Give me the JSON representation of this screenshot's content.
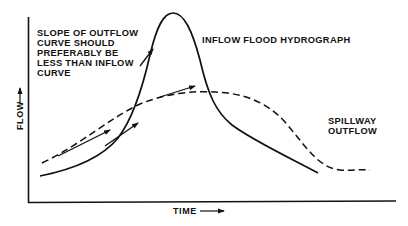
{
  "diagram": {
    "annotation_lines": [
      "SLOPE OF OUTFLOW",
      "CURVE SHOULD",
      "PREFERABLY BE",
      "LESS THAN INFLOW",
      "CURVE"
    ],
    "inflow_label": "INFLOW FLOOD HYDROGRAPH",
    "outflow_label_lines": [
      "SPILLWAY",
      "OUTFLOW"
    ],
    "y_axis_label": "FLOW",
    "x_axis_label": "TIME",
    "colors": {
      "ink": "#111111",
      "background": "#ffffff"
    }
  }
}
